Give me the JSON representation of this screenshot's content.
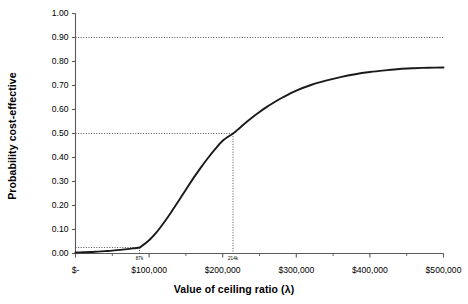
{
  "chart_data": {
    "type": "line",
    "title": "",
    "xlabel": "Value of ceiling ratio (λ)",
    "ylabel": "Probability cost-effective",
    "xlim": [
      0,
      500000
    ],
    "ylim": [
      0,
      1.0
    ],
    "grid": false,
    "legend": "none",
    "x_tick_labels": [
      "$-",
      "$100,000",
      "$200,000",
      "$300,000",
      "$400,000",
      "$500,000"
    ],
    "x_tick_values": [
      0,
      100000,
      200000,
      300000,
      400000,
      500000
    ],
    "x_minor_tick_values": [
      50000,
      150000,
      250000,
      350000,
      450000
    ],
    "y_tick_labels": [
      "0.00",
      "0.10",
      "0.20",
      "0.30",
      "0.40",
      "0.50",
      "0.60",
      "0.70",
      "0.80",
      "0.90",
      "1.00"
    ],
    "y_tick_values": [
      0.0,
      0.1,
      0.2,
      0.3,
      0.4,
      0.5,
      0.6,
      0.7,
      0.8,
      0.9,
      1.0
    ],
    "series": [
      {
        "name": "Cost-effectiveness acceptability curve",
        "color": "#1a1a1a",
        "x": [
          0,
          10000,
          20000,
          30000,
          40000,
          50000,
          60000,
          70000,
          80000,
          87000,
          90000,
          100000,
          110000,
          120000,
          130000,
          140000,
          150000,
          160000,
          170000,
          180000,
          190000,
          200000,
          214000,
          220000,
          230000,
          240000,
          250000,
          260000,
          270000,
          280000,
          290000,
          300000,
          320000,
          340000,
          360000,
          380000,
          400000,
          420000,
          440000,
          460000,
          480000,
          500000
        ],
        "y": [
          0.004,
          0.005,
          0.006,
          0.008,
          0.01,
          0.012,
          0.015,
          0.018,
          0.022,
          0.025,
          0.031,
          0.055,
          0.088,
          0.128,
          0.172,
          0.219,
          0.266,
          0.313,
          0.357,
          0.398,
          0.436,
          0.47,
          0.5,
          0.515,
          0.542,
          0.567,
          0.59,
          0.611,
          0.63,
          0.648,
          0.664,
          0.679,
          0.702,
          0.72,
          0.735,
          0.747,
          0.756,
          0.763,
          0.769,
          0.772,
          0.774,
          0.775
        ]
      }
    ],
    "annotations": [
      {
        "name": "upper-reference-line",
        "type": "horizontal-dotted",
        "y": 0.9,
        "x_from": 0,
        "x_to": 500000,
        "label": ""
      },
      {
        "name": "median-threshold",
        "type": "crosshair-dotted",
        "x": 214000,
        "y": 0.5,
        "label": "214k"
      },
      {
        "name": "lower-threshold",
        "type": "crosshair-dotted",
        "x": 87000,
        "y": 0.025,
        "label": "87k"
      }
    ]
  },
  "axes": {
    "x_title": "Value of ceiling ratio (λ)",
    "y_title": "Probability cost-effective"
  },
  "colors": {
    "curve": "#1a1a1a",
    "axis": "#5a5a5a",
    "dotted": "#555555",
    "background": "#ffffff"
  }
}
